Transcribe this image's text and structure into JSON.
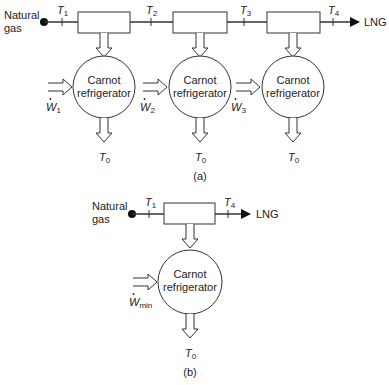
{
  "panel_a": {
    "caption": "(a)",
    "inlet_label_line1": "Natural",
    "inlet_label_line2": "gas",
    "outlet_label": "LNG",
    "temps": [
      {
        "sym": "T",
        "sub": "1"
      },
      {
        "sym": "T",
        "sub": "2"
      },
      {
        "sym": "T",
        "sub": "3"
      },
      {
        "sym": "T",
        "sub": "4"
      }
    ],
    "refrigerators": [
      {
        "line1": "Carnot",
        "line2": "refrigerator",
        "work_sym": "W",
        "work_sub": "1",
        "reject_sym": "T",
        "reject_sub": "0"
      },
      {
        "line1": "Carnot",
        "line2": "refrigerator",
        "work_sym": "W",
        "work_sub": "2",
        "reject_sym": "T",
        "reject_sub": "0"
      },
      {
        "line1": "Carnot",
        "line2": "refrigerator",
        "work_sym": "W",
        "work_sub": "3",
        "reject_sym": "T",
        "reject_sub": "0"
      }
    ]
  },
  "panel_b": {
    "caption": "(b)",
    "inlet_label_line1": "Natural",
    "inlet_label_line2": "gas",
    "outlet_label": "LNG",
    "temps": [
      {
        "sym": "T",
        "sub": "1"
      },
      {
        "sym": "T",
        "sub": "4"
      }
    ],
    "refrigerator": {
      "line1": "Carnot",
      "line2": "refrigerator",
      "work_sym": "W",
      "work_sub": "min",
      "reject_sym": "T",
      "reject_sub": "0"
    }
  },
  "colors": {
    "stroke": "#333333",
    "text": "#222222",
    "background": "#ffffff"
  }
}
